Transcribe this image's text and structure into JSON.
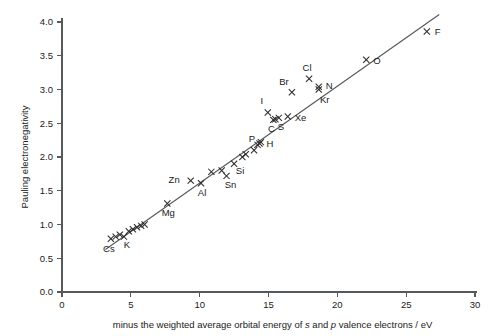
{
  "chart_data": {
    "type": "scatter",
    "title": "",
    "xlabel": "minus the weighted average orbital energy of s and p valence electrons / eV",
    "xlabel_parts": {
      "part1": "minus the weighted average orbital energy of ",
      "italic1": "s",
      "part2": " and ",
      "italic2": "p",
      "part3": " valence electrons / eV"
    },
    "ylabel": "Pauling electronegativity",
    "xlim": [
      0,
      30
    ],
    "ylim": [
      0,
      4.0
    ],
    "xticks": [
      0,
      5,
      10,
      15,
      20,
      25,
      30
    ],
    "xtick_labels": [
      "0",
      "5",
      "10",
      "15",
      "20",
      "25",
      "30"
    ],
    "yticks": [
      0.0,
      0.5,
      1.0,
      1.5,
      2.0,
      2.5,
      3.0,
      3.5,
      4.0
    ],
    "ytick_labels": [
      "0.0",
      "0.5",
      "1.0",
      "1.5",
      "2.0",
      "2.5",
      "3.0",
      "3.5",
      "4.0"
    ],
    "grid": false,
    "legend": false,
    "marker_style": "x",
    "trend_line": {
      "x0": 3.15,
      "y0": 0.63,
      "x1": 27.4,
      "y1": 4.11,
      "slope": 0.1435,
      "intercept": 0.178
    },
    "points": [
      {
        "label": "Cs",
        "x": 3.55,
        "y": 0.79,
        "label_dx": -2,
        "label_dy": 13,
        "label_anchor": "middle"
      },
      {
        "label": "",
        "x": 3.9,
        "y": 0.82,
        "label_dx": 0,
        "label_dy": 0,
        "label_anchor": "middle"
      },
      {
        "label": "",
        "x": 4.2,
        "y": 0.85,
        "label_dx": 0,
        "label_dy": 0,
        "label_anchor": "middle"
      },
      {
        "label": "K",
        "x": 4.5,
        "y": 0.82,
        "label_dx": 3,
        "label_dy": 11,
        "label_anchor": "middle"
      },
      {
        "label": "",
        "x": 4.85,
        "y": 0.9,
        "label_dx": 0,
        "label_dy": 0,
        "label_anchor": "middle"
      },
      {
        "label": "",
        "x": 5.15,
        "y": 0.93,
        "label_dx": 0,
        "label_dy": 0,
        "label_anchor": "middle"
      },
      {
        "label": "",
        "x": 5.45,
        "y": 0.96,
        "label_dx": 0,
        "label_dy": 0,
        "label_anchor": "middle"
      },
      {
        "label": "",
        "x": 5.75,
        "y": 0.98,
        "label_dx": 0,
        "label_dy": 0,
        "label_anchor": "middle"
      },
      {
        "label": "",
        "x": 6.0,
        "y": 1.0,
        "label_dx": 0,
        "label_dy": 0,
        "label_anchor": "middle"
      },
      {
        "label": "Mg",
        "x": 7.65,
        "y": 1.31,
        "label_dx": 1,
        "label_dy": 12,
        "label_anchor": "middle"
      },
      {
        "label": "Zn",
        "x": 9.35,
        "y": 1.65,
        "label_dx": -11,
        "label_dy": 2,
        "label_anchor": "end"
      },
      {
        "label": "Al",
        "x": 10.1,
        "y": 1.61,
        "label_dx": 1,
        "label_dy": 13,
        "label_anchor": "middle"
      },
      {
        "label": "",
        "x": 10.85,
        "y": 1.78,
        "label_dx": 0,
        "label_dy": 0,
        "label_anchor": "middle"
      },
      {
        "label": "",
        "x": 11.6,
        "y": 1.8,
        "label_dx": 0,
        "label_dy": 0,
        "label_anchor": "middle"
      },
      {
        "label": "Sn",
        "x": 11.95,
        "y": 1.72,
        "label_dx": 4,
        "label_dy": 12,
        "label_anchor": "middle"
      },
      {
        "label": "Si",
        "x": 12.5,
        "y": 1.9,
        "label_dx": 6,
        "label_dy": 10,
        "label_anchor": "middle"
      },
      {
        "label": "",
        "x": 13.1,
        "y": 2.0,
        "label_dx": 0,
        "label_dy": 0,
        "label_anchor": "middle"
      },
      {
        "label": "",
        "x": 13.35,
        "y": 2.04,
        "label_dx": 0,
        "label_dy": 0,
        "label_anchor": "middle"
      },
      {
        "label": "P",
        "x": 13.95,
        "y": 2.1,
        "label_dx": -2,
        "label_dy": -8,
        "label_anchor": "middle"
      },
      {
        "label": "H",
        "x": 14.35,
        "y": 2.2,
        "label_dx": 7,
        "label_dy": 3,
        "label_anchor": "start"
      },
      {
        "label": "",
        "x": 14.2,
        "y": 2.18,
        "label_dx": 0,
        "label_dy": 0,
        "label_anchor": "middle"
      },
      {
        "label": "",
        "x": 14.45,
        "y": 2.22,
        "label_dx": 0,
        "label_dy": 0,
        "label_anchor": "middle"
      },
      {
        "label": "C",
        "x": 15.35,
        "y": 2.55,
        "label_dx": -2,
        "label_dy": 12,
        "label_anchor": "middle"
      },
      {
        "label": "S",
        "x": 15.75,
        "y": 2.58,
        "label_dx": 2,
        "label_dy": 12,
        "label_anchor": "middle"
      },
      {
        "label": "",
        "x": 15.5,
        "y": 2.56,
        "label_dx": 0,
        "label_dy": 0,
        "label_anchor": "middle"
      },
      {
        "label": "I",
        "x": 14.95,
        "y": 2.66,
        "label_dx": -6,
        "label_dy": -8,
        "label_anchor": "middle"
      },
      {
        "label": "Xe",
        "x": 16.4,
        "y": 2.6,
        "label_dx": 7,
        "label_dy": 4,
        "label_anchor": "start"
      },
      {
        "label": "Br",
        "x": 16.7,
        "y": 2.96,
        "label_dx": -8,
        "label_dy": -7,
        "label_anchor": "middle"
      },
      {
        "label": "Cl",
        "x": 17.95,
        "y": 3.16,
        "label_dx": -2,
        "label_dy": -8,
        "label_anchor": "middle"
      },
      {
        "label": "N",
        "x": 18.65,
        "y": 3.04,
        "label_dx": 7,
        "label_dy": 2,
        "label_anchor": "start"
      },
      {
        "label": "Kr",
        "x": 18.65,
        "y": 3.0,
        "label_dx": 6,
        "label_dy": 13,
        "label_anchor": "middle"
      },
      {
        "label": "O",
        "x": 22.1,
        "y": 3.44,
        "label_dx": 7,
        "label_dy": 4,
        "label_anchor": "start"
      },
      {
        "label": "F",
        "x": 26.5,
        "y": 3.86,
        "label_dx": 8,
        "label_dy": 4,
        "label_anchor": "start"
      }
    ]
  },
  "colors": {
    "axis": "#55595c",
    "marker": "#2b2b2b",
    "line": "#55595c",
    "text": "#1a1a1a",
    "background": "#ffffff"
  }
}
